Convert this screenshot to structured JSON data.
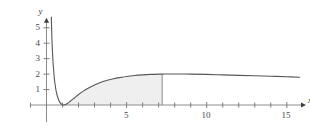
{
  "chart_data": {
    "type": "line",
    "title": "",
    "xlabel": "x",
    "ylabel": "y",
    "xlim": [
      -1.0,
      16.2
    ],
    "ylim": [
      -0.45,
      5.7
    ],
    "grid": false,
    "legend": null,
    "x_ticks_labeled": [
      {
        "value": 5,
        "label": "5"
      },
      {
        "value": 10,
        "label": "10"
      },
      {
        "value": 15,
        "label": "15"
      }
    ],
    "x_ticks_minor": [
      -1,
      0,
      1,
      2,
      3,
      4,
      6,
      7,
      8,
      9,
      11,
      12,
      13,
      14
    ],
    "y_ticks_labeled": [
      {
        "value": 1,
        "label": "1"
      },
      {
        "value": 2,
        "label": "2"
      },
      {
        "value": 3,
        "label": "3"
      },
      {
        "value": 4,
        "label": "4"
      },
      {
        "value": 5,
        "label": "5"
      }
    ],
    "axis_arrows": [
      "x-positive",
      "y-positive"
    ],
    "series": [
      {
        "name": "curve",
        "color": "#57575a",
        "points": [
          [
            0.3,
            5.7
          ],
          [
            0.33,
            4.55
          ],
          [
            0.36,
            3.7
          ],
          [
            0.4,
            2.9
          ],
          [
            0.45,
            2.2
          ],
          [
            0.5,
            1.62
          ],
          [
            0.56,
            1.16
          ],
          [
            0.62,
            0.82
          ],
          [
            0.7,
            0.5
          ],
          [
            0.78,
            0.28
          ],
          [
            0.86,
            0.14
          ],
          [
            0.95,
            0.04
          ],
          [
            1.05,
            0.0
          ],
          [
            1.15,
            0.02
          ],
          [
            1.3,
            0.1
          ],
          [
            1.5,
            0.26
          ],
          [
            1.75,
            0.47
          ],
          [
            2.0,
            0.68
          ],
          [
            2.3,
            0.9
          ],
          [
            2.6,
            1.09
          ],
          [
            3.0,
            1.3
          ],
          [
            3.4,
            1.47
          ],
          [
            3.8,
            1.6
          ],
          [
            4.2,
            1.7
          ],
          [
            4.6,
            1.78
          ],
          [
            5.0,
            1.85
          ],
          [
            5.5,
            1.91
          ],
          [
            6.0,
            1.95
          ],
          [
            6.5,
            1.98
          ],
          [
            7.0,
            2.0
          ],
          [
            7.2,
            2.0
          ],
          [
            8.0,
            2.01
          ],
          [
            9.0,
            2.0
          ],
          [
            10.0,
            1.98
          ],
          [
            11.0,
            1.95
          ],
          [
            12.0,
            1.92
          ],
          [
            13.0,
            1.89
          ],
          [
            14.0,
            1.86
          ],
          [
            15.0,
            1.83
          ],
          [
            15.8,
            1.8
          ]
        ]
      }
    ],
    "shaded_region": {
      "fill": "#efefef",
      "edge_color": "#8a8a8a",
      "x_from": 1.05,
      "x_to": 7.22,
      "baseline": 0,
      "description": "area under curve from x=1.05 to x=7.22"
    }
  },
  "labels": {
    "y_axis_name": "y",
    "x_axis_name": "x"
  }
}
